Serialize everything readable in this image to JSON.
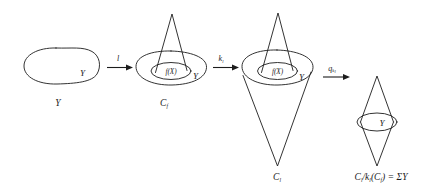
{
  "diagram": {
    "ink_color": "#1c1c1c",
    "background_color": "#ffffff",
    "stages": [
      {
        "id": "stage-1",
        "caption": "Y",
        "inner_labels": [
          "Y"
        ],
        "shape": "blob"
      },
      {
        "id": "stage-2",
        "caption_base": "C",
        "caption_sub": "f",
        "inner_labels": [
          "f(X)",
          "Y"
        ],
        "shape": "blob-with-inner-ellipse-and-up-cone"
      },
      {
        "id": "stage-3",
        "caption_base": "C",
        "caption_sub": "l",
        "inner_labels": [
          "f(X)",
          "Y"
        ],
        "shape": "blob-with-inner-ellipse-up-cone-and-down-cone"
      },
      {
        "id": "stage-4",
        "caption_full": "C_l/k_l(C_f) = ΣY",
        "caption_parts": {
          "c1": "C",
          "s1": "l",
          "slash": "/",
          "k": "k",
          "s2": "l",
          "open": "(",
          "c2": "C",
          "s3": "f",
          "close": ")",
          "eq": "=",
          "sigma": "Σ",
          "y": "Y"
        },
        "inner_labels": [
          "Y"
        ],
        "shape": "double-cone-suspension"
      }
    ],
    "arrows": [
      {
        "id": "arrow-1",
        "label_base": "l",
        "label_sub": "",
        "from": "stage-1",
        "to": "stage-2"
      },
      {
        "id": "arrow-2",
        "label_base": "k",
        "label_sub": "l",
        "from": "stage-2",
        "to": "stage-3"
      },
      {
        "id": "arrow-3",
        "label_base": "q",
        "label_sub": "k",
        "label_subsub": "l",
        "from": "stage-3",
        "to": "stage-4"
      }
    ]
  }
}
